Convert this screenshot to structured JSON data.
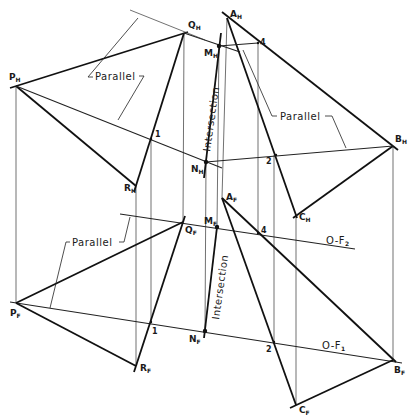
{
  "figure": {
    "type": "descriptive-geometry",
    "horizontal_view": {
      "points": {
        "P": {
          "label": "P",
          "sub": "H"
        },
        "Q": {
          "label": "Q",
          "sub": "H"
        },
        "R": {
          "label": "R",
          "sub": "H"
        },
        "A": {
          "label": "A",
          "sub": "H"
        },
        "B": {
          "label": "B",
          "sub": "H"
        },
        "C": {
          "label": "C",
          "sub": "H"
        },
        "M": {
          "label": "M",
          "sub": "H"
        },
        "N": {
          "label": "N",
          "sub": "H"
        }
      },
      "numbers": [
        "1",
        "2",
        "4"
      ],
      "annotations": {
        "parallel_left": "Parallel",
        "parallel_right": "Parallel",
        "intersection": "Intersection"
      }
    },
    "front_view": {
      "points": {
        "P": {
          "label": "P",
          "sub": "F"
        },
        "Q": {
          "label": "Q",
          "sub": "F"
        },
        "R": {
          "label": "R",
          "sub": "F"
        },
        "A": {
          "label": "A",
          "sub": "F"
        },
        "B": {
          "label": "B",
          "sub": "F"
        },
        "C": {
          "label": "C",
          "sub": "F"
        },
        "M": {
          "label": "M",
          "sub": "F"
        },
        "N": {
          "label": "N",
          "sub": "F"
        }
      },
      "numbers": [
        "1",
        "2",
        "4"
      ],
      "annotations": {
        "parallel": "Parallel",
        "intersection": "Intersection"
      },
      "cutting_planes": {
        "o_f1": {
          "label": "O-F",
          "sub": "1"
        },
        "o_f2": {
          "label": "O-F",
          "sub": "2"
        }
      }
    }
  }
}
